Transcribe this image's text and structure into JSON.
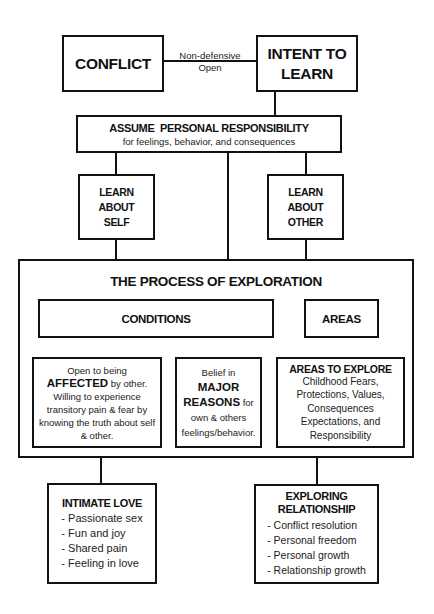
{
  "diagram": {
    "conflict": "CONFLICT",
    "connector_label": [
      "Non-defensive",
      "Open"
    ],
    "intent": [
      "INTENT TO",
      "LEARN"
    ],
    "responsibility": {
      "title": "ASSUME  PERSONAL RESPONSIBILITY",
      "subtitle": "for feelings, behavior, and consequences"
    },
    "learn_self": [
      "LEARN",
      "ABOUT",
      "SELF"
    ],
    "learn_other": [
      "LEARN",
      "ABOUT",
      "OTHER"
    ],
    "process": {
      "title": "THE PROCESS OF EXPLORATION",
      "conditions_label": "CONDITIONS",
      "areas_label": "AREAS",
      "condition_affected": {
        "pre": "Open to being ",
        "bold": "AFFECTED",
        "post": " by other. Willing to experience transitory pain & fear by knowing the truth about self & other."
      },
      "condition_reasons": {
        "pre": "Belief in ",
        "bold": "MAJOR REASONS",
        "post": " for own & others feelings/behavior."
      },
      "areas_to_explore": {
        "title": "AREAS TO EXPLORE",
        "text": "Childhood Fears, Protections, Values, Consequences Expectations, and Responsibility"
      }
    },
    "intimate_love": {
      "title": "INTIMATE LOVE",
      "items": [
        "- Passionate sex",
        "- Fun and joy",
        "- Shared pain",
        "- Feeling in love"
      ]
    },
    "exploring_relationship": {
      "title": [
        "EXPLORING",
        "RELATIONSHIP"
      ],
      "items": [
        "- Conflict resolution",
        "- Personal freedom",
        "- Personal growth",
        "- Relationship growth"
      ]
    }
  }
}
